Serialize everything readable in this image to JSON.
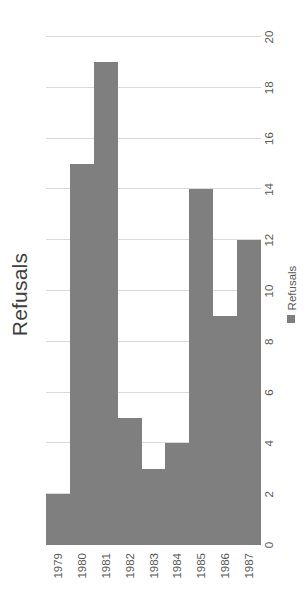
{
  "chart_data": {
    "type": "bar",
    "orientation": "horizontal",
    "title": "Refusals",
    "xlabel": "",
    "ylabel": "",
    "categories": [
      "1979",
      "1980",
      "1981",
      "1982",
      "1983",
      "1984",
      "1985",
      "1986",
      "1987"
    ],
    "series": [
      {
        "name": "Refusals",
        "color": "#7F7F7F",
        "values": [
          2,
          15,
          19,
          5,
          3,
          4,
          14,
          9,
          12
        ]
      }
    ],
    "values": [
      2,
      15,
      19,
      5,
      3,
      4,
      14,
      9,
      12
    ],
    "xlim": [
      0,
      20
    ],
    "ylim": [
      0,
      20
    ],
    "ticks": [
      "0",
      "2",
      "4",
      "6",
      "8",
      "10",
      "12",
      "14",
      "16",
      "18",
      "20"
    ],
    "tick_values": [
      0,
      2,
      4,
      6,
      8,
      10,
      12,
      14,
      16,
      18,
      20
    ],
    "grid": true,
    "grid_axis": "value",
    "legend": {
      "position": "bottom",
      "entries": [
        {
          "label": "Refusals",
          "marker": "square-swatch",
          "color": "#7F7F7F"
        }
      ]
    },
    "colors": {
      "bar": "#7F7F7F",
      "gridline": "#D9D9D9",
      "axis_line": "#BFBFBF",
      "title_text": "#3F3F3F",
      "tick_text": "#595959",
      "background": "#FFFFFF"
    }
  },
  "legend": {
    "label": "Refusals"
  },
  "title": {
    "text": "Refusals"
  }
}
